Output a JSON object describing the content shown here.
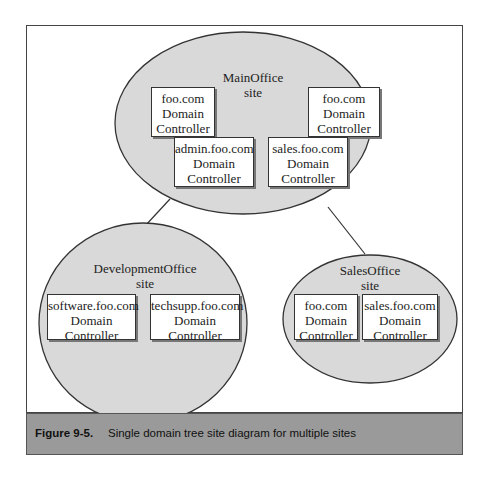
{
  "figure": {
    "number": "Figure 9-5.",
    "caption": "Single domain tree site diagram for multiple sites"
  },
  "sites": [
    {
      "name": "MainOffice",
      "suffix": "site",
      "controllers": [
        {
          "domain": "foo.com",
          "line2": "Domain",
          "line3": "Controller"
        },
        {
          "domain": "foo.com",
          "line2": "Domain",
          "line3": "Controller"
        },
        {
          "domain": "admin.foo.com",
          "line2": "Domain",
          "line3": "Controller"
        },
        {
          "domain": "sales.foo.com",
          "line2": "Domain",
          "line3": "Controller"
        }
      ]
    },
    {
      "name": "DevelopmentOffice",
      "suffix": "site",
      "controllers": [
        {
          "domain": "software.foo.com",
          "line2": "Domain",
          "line3": "Controller"
        },
        {
          "domain": "techsupp.foo.com",
          "line2": "Domain",
          "line3": "Controller"
        }
      ]
    },
    {
      "name": "SalesOffice",
      "suffix": "site",
      "controllers": [
        {
          "domain": "foo.com",
          "line2": "Domain",
          "line3": "Controller"
        },
        {
          "domain": "sales.foo.com",
          "line2": "Domain",
          "line3": "Controller"
        }
      ]
    }
  ],
  "connections": [
    {
      "from": "MainOffice",
      "to": "DevelopmentOffice"
    },
    {
      "from": "MainOffice",
      "to": "SalesOffice"
    }
  ],
  "colors": {
    "site_fill": "#d9d9d9",
    "caption_bg": "#9a9a9a",
    "stroke": "#333333"
  }
}
